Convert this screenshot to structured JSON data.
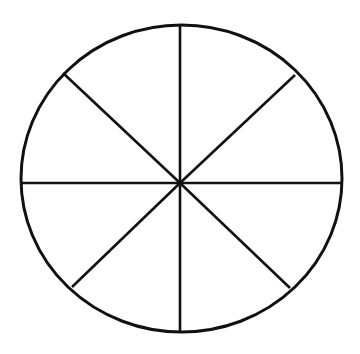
{
  "diagram": {
    "type": "circle-divided-into-sectors",
    "sectors": 8,
    "colors": {
      "background": "#ffffff",
      "stroke": "#111111"
    },
    "circle": {
      "cx": 181.5,
      "cy": 178.5,
      "rx": 160.5,
      "ry": 153.5,
      "stroke_width": 3
    },
    "hub": {
      "x": 180,
      "y": 183
    },
    "spoke_stroke_width": 2.6,
    "spokes": [
      {
        "name": "spoke-top",
        "x2": 180,
        "y2": 25
      },
      {
        "name": "spoke-upper-right",
        "x2": 295,
        "y2": 75
      },
      {
        "name": "spoke-right",
        "x2": 341,
        "y2": 183
      },
      {
        "name": "spoke-lower-right",
        "x2": 290,
        "y2": 288
      },
      {
        "name": "spoke-bottom",
        "x2": 180,
        "y2": 331
      },
      {
        "name": "spoke-lower-left",
        "x2": 72,
        "y2": 287
      },
      {
        "name": "spoke-left",
        "x2": 22,
        "y2": 183
      },
      {
        "name": "spoke-upper-left",
        "x2": 63,
        "y2": 73
      }
    ]
  }
}
